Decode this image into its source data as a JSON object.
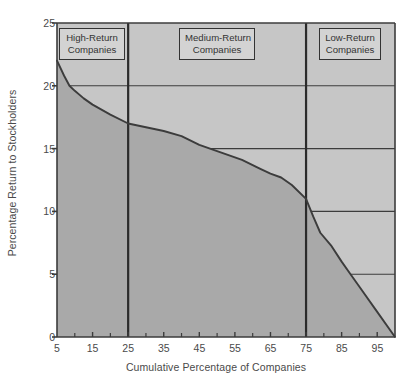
{
  "chart_data": {
    "type": "area",
    "title": "",
    "xlabel": "Cumulative Percentage of Companies",
    "ylabel": "Percentage Return to Stockholders",
    "xlim": [
      5,
      100
    ],
    "ylim": [
      0,
      25
    ],
    "xticks": [
      5,
      15,
      25,
      35,
      45,
      55,
      65,
      75,
      85,
      95
    ],
    "xtick_labels": [
      "5",
      "15",
      "25",
      "35",
      "45",
      "55",
      "65",
      "75",
      "85",
      "95"
    ],
    "xminor_ticks": [
      10,
      20,
      30,
      40,
      50,
      60,
      70,
      80,
      90,
      100
    ],
    "yticks": [
      0,
      5,
      10,
      15,
      20,
      25
    ],
    "ytick_labels": [
      "0",
      "5",
      "10",
      "15",
      "20",
      "25"
    ],
    "grid": "horizontal-gridlines-at-y-5-10-15-20 drawn only where above the curve",
    "legend": "none",
    "x": [
      5,
      7,
      8.5,
      10,
      12.5,
      15,
      20,
      25,
      30,
      35,
      40,
      45,
      48,
      52,
      57,
      62,
      65,
      68,
      71,
      75,
      77,
      79,
      82,
      85,
      87.5,
      90,
      95,
      100
    ],
    "values": [
      22.0,
      20.8,
      20.0,
      19.6,
      19.0,
      18.5,
      17.7,
      17.0,
      16.7,
      16.4,
      16.0,
      15.3,
      15.0,
      14.6,
      14.1,
      13.4,
      13.0,
      12.7,
      12.1,
      11.0,
      9.6,
      8.3,
      7.3,
      6.0,
      5.0,
      4.0,
      2.0,
      0.0
    ],
    "series": [
      {
        "name": "Cumulative return distribution",
        "values": [
          22.0,
          20.8,
          20.0,
          19.6,
          19.0,
          18.5,
          17.7,
          17.0,
          16.7,
          16.4,
          16.0,
          15.3,
          15.0,
          14.6,
          14.1,
          13.4,
          13.0,
          12.7,
          12.1,
          11.0,
          9.6,
          8.3,
          7.3,
          6.0,
          5.0,
          4.0,
          2.0,
          0.0
        ]
      }
    ],
    "annotations": [
      {
        "label": "High-Return\nCompanies",
        "x_range": [
          5,
          25
        ]
      },
      {
        "label": "Medium-Return\nCompanies",
        "x_range": [
          25,
          75
        ]
      },
      {
        "label": "Low-Return\nCompanies",
        "x_range": [
          75,
          100
        ]
      }
    ],
    "dividers": [
      25,
      75
    ],
    "colors": {
      "area_below_curve": "#a9a9a9",
      "area_above_curve": "#c6c6c6",
      "curve": "#3c3c3c",
      "axis": "#3c3c3c",
      "gridline": "#3c3c3c",
      "divider": "#2b2b2b",
      "box_fill": "#d3d3d3",
      "box_border": "#333333",
      "text": "#4a4a4a"
    }
  },
  "axes": {
    "ylabel": "Percentage Return to Stockholders",
    "xlabel": "Cumulative Percentage of Companies"
  },
  "segments": {
    "high": {
      "line1": "High-Return",
      "line2": "Companies"
    },
    "medium": {
      "line1": "Medium-Return",
      "line2": "Companies"
    },
    "low": {
      "line1": "Low-Return",
      "line2": "Companies"
    }
  },
  "yticks": {
    "t0": "0",
    "t1": "5",
    "t2": "10",
    "t3": "15",
    "t4": "20",
    "t5": "25"
  },
  "xticks": {
    "t0": "5",
    "t1": "15",
    "t2": "25",
    "t3": "35",
    "t4": "45",
    "t5": "55",
    "t6": "65",
    "t7": "75",
    "t8": "85",
    "t9": "95"
  }
}
